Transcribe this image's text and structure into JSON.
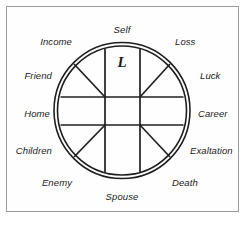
{
  "diagram": {
    "center_letter": "L",
    "frame_color": "#9a9a9a",
    "line_color": "#1f1f1f",
    "background_color": "#ffffff",
    "circle": {
      "cx": 122,
      "cy": 110.5,
      "r_outer": 68,
      "r_inner": 64.5
    },
    "inner_square": {
      "left": 105,
      "top": 97,
      "right": 140,
      "bottom": 125
    },
    "houses": [
      {
        "id": "self",
        "label": "Self",
        "x": 122,
        "y": 29,
        "align": "ctr"
      },
      {
        "id": "loss",
        "label": "Loss",
        "x": 175,
        "y": 41,
        "align": "lft"
      },
      {
        "id": "luck",
        "label": "Luck",
        "x": 200,
        "y": 75,
        "align": "lft"
      },
      {
        "id": "career",
        "label": "Career",
        "x": 198,
        "y": 113,
        "align": "lft"
      },
      {
        "id": "exaltation",
        "label": "Exaltation",
        "x": 190,
        "y": 150,
        "align": "lft"
      },
      {
        "id": "death",
        "label": "Death",
        "x": 172,
        "y": 182,
        "align": "lft"
      },
      {
        "id": "spouse",
        "label": "Spouse",
        "x": 122,
        "y": 196,
        "align": "ctr"
      },
      {
        "id": "enemy",
        "label": "Enemy",
        "x": 72,
        "y": 182,
        "align": "rgt"
      },
      {
        "id": "children",
        "label": "Children",
        "x": 52,
        "y": 150,
        "align": "rgt"
      },
      {
        "id": "home",
        "label": "Home",
        "x": 50,
        "y": 113,
        "align": "rgt"
      },
      {
        "id": "friend",
        "label": "Friend",
        "x": 52,
        "y": 75,
        "align": "rgt"
      },
      {
        "id": "income",
        "label": "Income",
        "x": 72,
        "y": 41,
        "align": "rgt"
      }
    ]
  }
}
